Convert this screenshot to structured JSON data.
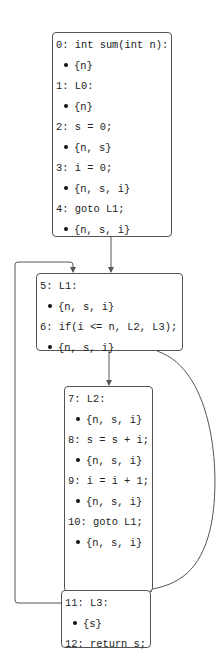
{
  "diagram": {
    "type": "control-flow-graph",
    "nodes": [
      {
        "id": "B0",
        "lines": [
          {
            "kind": "stmt",
            "text": "0: int sum(int n):"
          },
          {
            "kind": "fact",
            "text": "{n}"
          },
          {
            "kind": "stmt",
            "text": "1: L0:"
          },
          {
            "kind": "fact",
            "text": "{n}"
          },
          {
            "kind": "stmt",
            "text": "2: s = 0;"
          },
          {
            "kind": "fact",
            "text": "{n, s}"
          },
          {
            "kind": "stmt",
            "text": "3: i = 0;"
          },
          {
            "kind": "fact",
            "text": "{n, s, i}"
          },
          {
            "kind": "stmt",
            "text": "4: goto L1;"
          },
          {
            "kind": "fact",
            "text": "{n, s, i}"
          }
        ]
      },
      {
        "id": "B1",
        "lines": [
          {
            "kind": "stmt",
            "text": "5: L1:"
          },
          {
            "kind": "fact",
            "text": "{n, s, i}"
          },
          {
            "kind": "stmt",
            "text": "6: if(i <= n, L2, L3);"
          },
          {
            "kind": "fact",
            "text": "{n, s, i}"
          }
        ]
      },
      {
        "id": "B2",
        "lines": [
          {
            "kind": "stmt",
            "text": "7: L2:"
          },
          {
            "kind": "fact",
            "text": "{n, s, i}"
          },
          {
            "kind": "stmt",
            "text": "8: s = s + i;"
          },
          {
            "kind": "fact",
            "text": "{n, s, i}"
          },
          {
            "kind": "stmt",
            "text": "9: i = i + 1;"
          },
          {
            "kind": "fact",
            "text": "{n, s, i}"
          },
          {
            "kind": "stmt",
            "text": "10: goto L1;"
          },
          {
            "kind": "fact",
            "text": "{n, s, i}"
          }
        ]
      },
      {
        "id": "B3",
        "lines": [
          {
            "kind": "stmt",
            "text": "11: L3:"
          },
          {
            "kind": "fact",
            "text": "{s}"
          },
          {
            "kind": "stmt",
            "text": "12: return s;"
          }
        ]
      }
    ],
    "edges": [
      {
        "from": "B0",
        "to": "B1"
      },
      {
        "from": "B1",
        "to": "B2"
      },
      {
        "from": "B1",
        "to": "B3"
      },
      {
        "from": "B2",
        "to": "B1"
      }
    ],
    "colors": {
      "border": "#555555",
      "edge": "#555555",
      "text": "#222222"
    }
  }
}
